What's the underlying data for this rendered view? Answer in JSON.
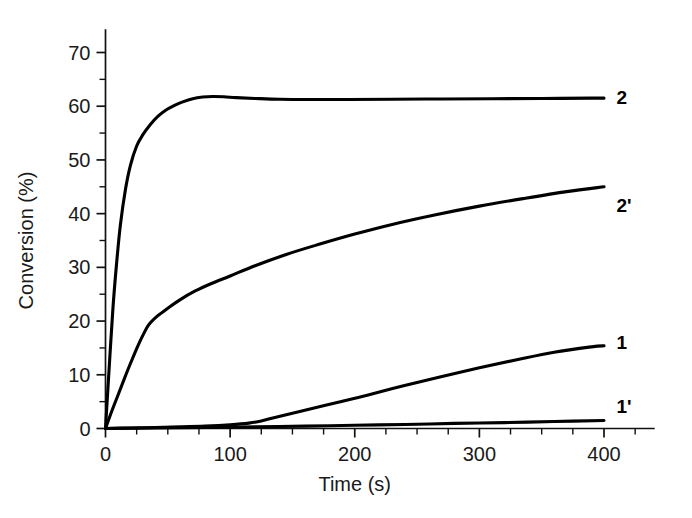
{
  "chart_data": {
    "type": "line",
    "title": "",
    "xlabel": "Time (s)",
    "ylabel": "Conversion (%)",
    "xlim": [
      0,
      440
    ],
    "ylim": [
      0,
      74
    ],
    "xticks": [
      0,
      100,
      200,
      300,
      400
    ],
    "xtick_labels": [
      "0",
      "100",
      "200",
      "300",
      "400"
    ],
    "xticks_minor_step": 25,
    "yticks": [
      0,
      10,
      20,
      30,
      40,
      50,
      60,
      70
    ],
    "ytick_labels": [
      "0",
      "10",
      "20",
      "30",
      "40",
      "50",
      "60",
      "70"
    ],
    "yticks_minor_step": 5,
    "grid": false,
    "legend_position": "right-inline-labels",
    "series": [
      {
        "name": "2",
        "label": "2",
        "label_x": 410,
        "label_y": 61.5,
        "x": [
          0,
          3,
          6,
          9,
          12,
          16,
          20,
          25,
          30,
          36,
          42,
          48,
          55,
          62,
          70,
          78,
          86,
          95,
          105,
          120,
          140,
          165,
          195,
          230,
          270,
          310,
          350,
          390,
          400
        ],
        "y": [
          0,
          11.5,
          22.5,
          31.0,
          38.0,
          44.5,
          49.0,
          52.6,
          54.7,
          56.6,
          58.1,
          59.2,
          60.1,
          60.8,
          61.4,
          61.7,
          61.8,
          61.75,
          61.6,
          61.45,
          61.3,
          61.25,
          61.25,
          61.3,
          61.35,
          61.4,
          61.45,
          61.5,
          61.5
        ]
      },
      {
        "name": "2'",
        "label": "2'",
        "label_x": 410,
        "label_y": 41.5,
        "x": [
          0,
          5,
          10,
          15,
          20,
          26,
          31,
          35,
          42,
          50,
          60,
          72,
          85,
          100,
          120,
          145,
          170,
          200,
          230,
          265,
          300,
          335,
          370,
          400
        ],
        "y": [
          0,
          3.2,
          6.2,
          9.2,
          12.1,
          15.4,
          17.8,
          19.4,
          21.0,
          22.4,
          24.0,
          25.6,
          27.0,
          28.4,
          30.3,
          32.4,
          34.2,
          36.2,
          38.0,
          39.8,
          41.4,
          42.8,
          44.1,
          45.0
        ]
      },
      {
        "name": "1",
        "label": "1",
        "label_x": 410,
        "label_y": 16.0,
        "x": [
          0,
          20,
          40,
          60,
          80,
          100,
          115,
          125,
          140,
          160,
          185,
          210,
          240,
          270,
          300,
          330,
          360,
          390,
          400
        ],
        "y": [
          0,
          0.1,
          0.2,
          0.3,
          0.45,
          0.7,
          1.0,
          1.4,
          2.3,
          3.4,
          4.8,
          6.2,
          8.0,
          9.7,
          11.3,
          12.8,
          14.2,
          15.2,
          15.4
        ]
      },
      {
        "name": "1'",
        "label": "1'",
        "label_x": 410,
        "label_y": 4.0,
        "x": [
          0,
          40,
          80,
          120,
          160,
          200,
          240,
          280,
          320,
          360,
          400
        ],
        "y": [
          0,
          0.1,
          0.2,
          0.3,
          0.45,
          0.6,
          0.75,
          0.95,
          1.1,
          1.3,
          1.5
        ]
      }
    ]
  },
  "colors": {
    "line": "#000000",
    "axis": "#111111",
    "text": "#1a1a1a",
    "background": "#ffffff"
  }
}
